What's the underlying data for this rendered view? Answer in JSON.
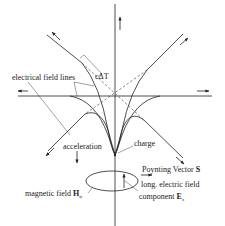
{
  "diagram": {
    "title": "",
    "labels": {
      "field_lines": "electrical field lines",
      "c_delta_t": "cΔT",
      "acceleration": "acceleration",
      "charge": "charge",
      "poynting": "Poynting Vector ",
      "poynting_symbol": "S",
      "long_field_line1": "long. electric field",
      "long_field_line2": "component ",
      "long_field_symbol": "E",
      "long_field_subscript": "z",
      "magnetic": "magnetic field ",
      "magnetic_symbol": "H",
      "magnetic_subscript": "φ"
    },
    "colors": {
      "stroke": "#222222",
      "background": "#ffffff"
    }
  }
}
